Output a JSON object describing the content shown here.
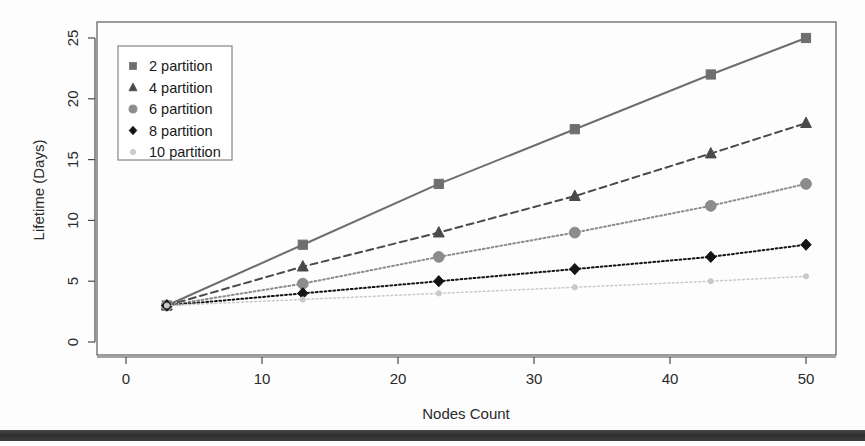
{
  "chart_data": {
    "type": "line",
    "title": "",
    "xlabel": "Nodes Count",
    "ylabel": "Lifetime (Days)",
    "xlim": [
      0,
      52
    ],
    "ylim": [
      0,
      26
    ],
    "xticks": [
      0,
      10,
      20,
      30,
      40,
      50
    ],
    "yticks": [
      0,
      5,
      10,
      15,
      20,
      25
    ],
    "xtick_labels": [
      "0",
      "10",
      "20",
      "30",
      "40",
      "50"
    ],
    "ytick_labels": [
      "0",
      "5",
      "10",
      "15",
      "20",
      "25"
    ],
    "grid": false,
    "legend_position": "top-left",
    "x": [
      3,
      13,
      23,
      33,
      43,
      50
    ],
    "series": [
      {
        "name": "2 partition",
        "values": [
          3,
          8,
          13,
          17.5,
          22,
          25
        ],
        "marker": "square",
        "linestyle": "solid",
        "color": "#6e6e6e"
      },
      {
        "name": "4 partition",
        "values": [
          3,
          6.2,
          9,
          12,
          15.5,
          18
        ],
        "marker": "triangle",
        "linestyle": "dashed",
        "color": "#4a4a4a"
      },
      {
        "name": "6 partition",
        "values": [
          3,
          4.8,
          7,
          9,
          11.2,
          13
        ],
        "marker": "circle",
        "linestyle": "dotted",
        "color": "#8c8c8c"
      },
      {
        "name": "8 partition",
        "values": [
          3,
          4,
          5,
          6,
          7,
          8
        ],
        "marker": "diamond",
        "linestyle": "dotted",
        "color": "#141414"
      },
      {
        "name": "10 partition",
        "values": [
          3,
          3.5,
          4,
          4.5,
          5,
          5.4
        ],
        "marker": "dot",
        "linestyle": "dotted",
        "color": "#c9c9c9"
      }
    ]
  },
  "legend": {
    "items": [
      {
        "label": "2 partition"
      },
      {
        "label": "4 partition"
      },
      {
        "label": "6 partition"
      },
      {
        "label": "8 partition"
      },
      {
        "label": "10 partition"
      }
    ]
  },
  "axes": {
    "x_title": "Nodes Count",
    "y_title": "Lifetime (Days)"
  }
}
